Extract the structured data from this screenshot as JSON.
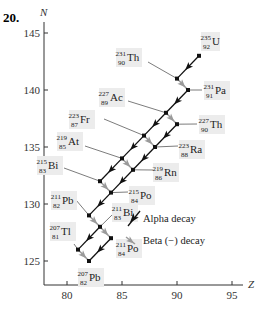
{
  "problem_number": "20.",
  "chart_data": {
    "type": "scatter",
    "title": "",
    "xlabel": "Z",
    "ylabel": "N",
    "xlim": [
      78,
      96
    ],
    "ylim": [
      123,
      146
    ],
    "x_ticks": [
      80,
      85,
      90,
      95
    ],
    "y_ticks": [
      125,
      130,
      135,
      140,
      145
    ],
    "grid": false,
    "nuclides": [
      {
        "id": "U235",
        "symbol": "U",
        "A": 235,
        "Z": 92,
        "N": 143
      },
      {
        "id": "Th231",
        "symbol": "Th",
        "A": 231,
        "Z": 90,
        "N": 141
      },
      {
        "id": "Pa231",
        "symbol": "Pa",
        "A": 231,
        "Z": 91,
        "N": 140
      },
      {
        "id": "Ac227",
        "symbol": "Ac",
        "A": 227,
        "Z": 89,
        "N": 138
      },
      {
        "id": "Th227",
        "symbol": "Th",
        "A": 227,
        "Z": 90,
        "N": 137
      },
      {
        "id": "Fr223",
        "symbol": "Fr",
        "A": 223,
        "Z": 87,
        "N": 136
      },
      {
        "id": "Ra223",
        "symbol": "Ra",
        "A": 223,
        "Z": 88,
        "N": 135
      },
      {
        "id": "At219",
        "symbol": "At",
        "A": 219,
        "Z": 85,
        "N": 134
      },
      {
        "id": "Rn219",
        "symbol": "Rn",
        "A": 219,
        "Z": 86,
        "N": 133
      },
      {
        "id": "Bi215",
        "symbol": "Bi",
        "A": 215,
        "Z": 83,
        "N": 132
      },
      {
        "id": "Po215",
        "symbol": "Po",
        "A": 215,
        "Z": 84,
        "N": 131
      },
      {
        "id": "Pb211",
        "symbol": "Pb",
        "A": 211,
        "Z": 82,
        "N": 129
      },
      {
        "id": "Bi211",
        "symbol": "Bi",
        "A": 211,
        "Z": 83,
        "N": 128
      },
      {
        "id": "Po211",
        "symbol": "Po",
        "A": 211,
        "Z": 84,
        "N": 127
      },
      {
        "id": "Tl207",
        "symbol": "Tl",
        "A": 207,
        "Z": 81,
        "N": 126
      },
      {
        "id": "Pb207",
        "symbol": "Pb",
        "A": 207,
        "Z": 82,
        "N": 125
      }
    ],
    "decays": [
      {
        "from": "U235",
        "to": "Th231",
        "type": "alpha"
      },
      {
        "from": "Th231",
        "to": "Pa231",
        "type": "beta"
      },
      {
        "from": "Pa231",
        "to": "Ac227",
        "type": "alpha"
      },
      {
        "from": "Ac227",
        "to": "Fr223",
        "type": "alpha"
      },
      {
        "from": "Ac227",
        "to": "Th227",
        "type": "beta"
      },
      {
        "from": "Th227",
        "to": "Ra223",
        "type": "alpha"
      },
      {
        "from": "Fr223",
        "to": "At219",
        "type": "alpha"
      },
      {
        "from": "Fr223",
        "to": "Ra223",
        "type": "beta"
      },
      {
        "from": "Ra223",
        "to": "Rn219",
        "type": "alpha"
      },
      {
        "from": "At219",
        "to": "Bi215",
        "type": "alpha"
      },
      {
        "from": "At219",
        "to": "Rn219",
        "type": "beta"
      },
      {
        "from": "Rn219",
        "to": "Po215",
        "type": "alpha"
      },
      {
        "from": "Bi215",
        "to": "Po215",
        "type": "beta"
      },
      {
        "from": "Po215",
        "to": "Pb211",
        "type": "alpha"
      },
      {
        "from": "Pb211",
        "to": "Bi211",
        "type": "beta"
      },
      {
        "from": "Bi211",
        "to": "Tl207",
        "type": "alpha"
      },
      {
        "from": "Bi211",
        "to": "Po211",
        "type": "beta"
      },
      {
        "from": "Po211",
        "to": "Pb207",
        "type": "alpha"
      },
      {
        "from": "Tl207",
        "to": "Pb207",
        "type": "beta"
      }
    ],
    "legend": [
      {
        "label": "Alpha decay",
        "color": "#000000"
      },
      {
        "label": "Beta (−) decay",
        "color": "#999999"
      }
    ]
  },
  "colors": {
    "alpha": "#111111",
    "beta": "#9a9a9a",
    "label_bg": "#ececec",
    "axis": "#333333"
  }
}
